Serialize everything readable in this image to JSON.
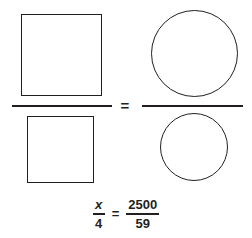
{
  "figure": {
    "shape_equation": {
      "left_fraction": {
        "numerator_shape": "large-square",
        "denominator_shape": "small-square"
      },
      "equals_symbol": "=",
      "right_fraction": {
        "numerator_shape": "large-circle",
        "denominator_shape": "small-circle"
      }
    },
    "numeric_equation": {
      "left_fraction": {
        "numerator": "x",
        "denominator": "4"
      },
      "equals_symbol": "=",
      "right_fraction": {
        "numerator": "2500",
        "denominator": "59"
      }
    }
  },
  "style": {
    "stroke_color": "#231f20",
    "background_color": "#ffffff"
  }
}
